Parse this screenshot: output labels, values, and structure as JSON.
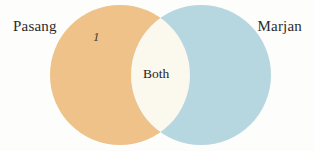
{
  "figure": {
    "type": "venn-diagram",
    "background_color": "#fdfdfb",
    "sets": [
      {
        "name": "left-set",
        "label": "Pasang",
        "fill_color": "#EFC28A",
        "cx": 120,
        "cy": 75,
        "r": 70
      },
      {
        "name": "right-set",
        "label": "Marjan",
        "fill_color": "#B6D6E0",
        "cx": 201,
        "cy": 75,
        "r": 70
      }
    ],
    "regions": [
      {
        "name": "left-only",
        "label": "1",
        "fill_color": "#EFC28A",
        "text_style": "italic"
      },
      {
        "name": "intersection",
        "label": "Both",
        "fill_color": "#FBF8EE",
        "text_style": "normal"
      }
    ],
    "label_color": "#2b2b2b"
  }
}
